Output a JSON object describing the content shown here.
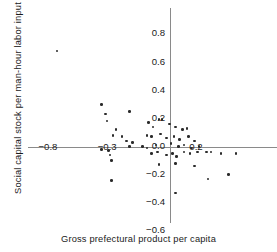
{
  "chart_data": {
    "type": "scatter",
    "title": "",
    "xlabel": "Gross prefectural product per capita",
    "ylabel": "Social capital stock per man-hour labor input",
    "xlim": [
      -1.0,
      0.65
    ],
    "ylim": [
      -0.6,
      0.85
    ],
    "grid": false,
    "legend": null,
    "xticks": [
      {
        "value": -0.8,
        "label": "−0.8"
      },
      {
        "value": -0.4,
        "label": "−0.3"
      },
      {
        "value": 0.2,
        "label": "0.2"
      }
    ],
    "yticks": [
      {
        "value": 0.8,
        "label": "0.8"
      },
      {
        "value": 0.6,
        "label": "0.6"
      },
      {
        "value": 0.4,
        "label": "0.4"
      },
      {
        "value": 0.2,
        "label": "0.2"
      },
      {
        "value": 0.0,
        "label": "0.0"
      },
      {
        "value": -0.2,
        "label": "−0.2"
      },
      {
        "value": -0.4,
        "label": "−0.4"
      },
      {
        "value": -0.6,
        "label": "−0.6"
      }
    ],
    "marker": {
      "shape": "circle",
      "color": "#2b2b2b",
      "size": 2.6
    },
    "points": [
      {
        "x": -0.74,
        "y": 0.68
      },
      {
        "x": -0.44,
        "y": 0.3
      },
      {
        "x": -0.41,
        "y": 0.23
      },
      {
        "x": -0.25,
        "y": 0.25
      },
      {
        "x": -0.4,
        "y": 0.18
      },
      {
        "x": -0.34,
        "y": 0.12
      },
      {
        "x": -0.36,
        "y": 0.08
      },
      {
        "x": -0.3,
        "y": 0.07
      },
      {
        "x": -0.27,
        "y": 0.04
      },
      {
        "x": -0.23,
        "y": 0.03
      },
      {
        "x": -0.25,
        "y": 0.0
      },
      {
        "x": -0.44,
        "y": -0.02
      },
      {
        "x": -0.39,
        "y": -0.03
      },
      {
        "x": -0.38,
        "y": -0.06
      },
      {
        "x": -0.37,
        "y": -0.1
      },
      {
        "x": -0.37,
        "y": -0.24
      },
      {
        "x": -0.12,
        "y": 0.17
      },
      {
        "x": -0.09,
        "y": 0.14
      },
      {
        "x": -0.05,
        "y": 0.19
      },
      {
        "x": -0.03,
        "y": 0.19
      },
      {
        "x": 0.02,
        "y": 0.16
      },
      {
        "x": 0.06,
        "y": 0.14
      },
      {
        "x": 0.11,
        "y": 0.12
      },
      {
        "x": 0.14,
        "y": 0.13
      },
      {
        "x": -0.13,
        "y": 0.08
      },
      {
        "x": -0.1,
        "y": 0.07
      },
      {
        "x": -0.04,
        "y": 0.09
      },
      {
        "x": 0.0,
        "y": 0.06
      },
      {
        "x": 0.05,
        "y": 0.07
      },
      {
        "x": 0.09,
        "y": 0.05
      },
      {
        "x": 0.15,
        "y": 0.07
      },
      {
        "x": 0.19,
        "y": 0.04
      },
      {
        "x": -0.16,
        "y": 0.0
      },
      {
        "x": -0.13,
        "y": -0.01
      },
      {
        "x": -0.07,
        "y": 0.01
      },
      {
        "x": 0.03,
        "y": 0.02
      },
      {
        "x": 0.08,
        "y": 0.0
      },
      {
        "x": 0.12,
        "y": 0.01
      },
      {
        "x": 0.17,
        "y": -0.01
      },
      {
        "x": 0.22,
        "y": 0.0
      },
      {
        "x": -0.1,
        "y": -0.05
      },
      {
        "x": -0.06,
        "y": -0.04
      },
      {
        "x": 0.0,
        "y": -0.06
      },
      {
        "x": 0.04,
        "y": -0.05
      },
      {
        "x": 0.07,
        "y": -0.07
      },
      {
        "x": 0.12,
        "y": -0.04
      },
      {
        "x": 0.16,
        "y": -0.05
      },
      {
        "x": 0.21,
        "y": -0.04
      },
      {
        "x": 0.27,
        "y": -0.04
      },
      {
        "x": 0.3,
        "y": -0.04
      },
      {
        "x": 0.37,
        "y": -0.05
      },
      {
        "x": 0.47,
        "y": -0.05
      },
      {
        "x": -0.05,
        "y": -0.13
      },
      {
        "x": 0.06,
        "y": -0.12
      },
      {
        "x": 0.19,
        "y": -0.14
      },
      {
        "x": 0.28,
        "y": -0.23
      },
      {
        "x": 0.42,
        "y": -0.2
      },
      {
        "x": 0.06,
        "y": -0.33
      }
    ]
  }
}
